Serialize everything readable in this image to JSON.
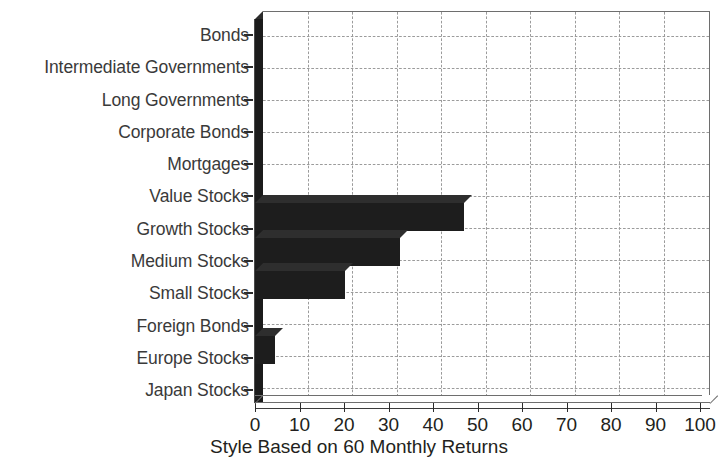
{
  "chart_data": {
    "type": "bar",
    "orientation": "horizontal",
    "title": "",
    "xlabel": "Style Based on 60 Monthly Returns",
    "ylabel": "",
    "categories": [
      "Bonds",
      "Intermediate Governments",
      "Long Governments",
      "Corporate Bonds",
      "Mortgages",
      "Value Stocks",
      "Growth Stocks",
      "Medium Stocks",
      "Small Stocks",
      "Foreign Bonds",
      "Europe Stocks",
      "Japan Stocks"
    ],
    "values": [
      0,
      0,
      0,
      0,
      0,
      0,
      47,
      32,
      20,
      0,
      4.5,
      0
    ],
    "xlim": [
      0,
      100
    ],
    "xticks": [
      0,
      10,
      20,
      30,
      40,
      50,
      60,
      70,
      80,
      90,
      100
    ],
    "xtick_labels": [
      "0",
      "10",
      "20",
      "30",
      "40",
      "50",
      "60",
      "70",
      "80",
      "90",
      "100"
    ],
    "grid": true,
    "grid_style": "dotted",
    "legend": "none",
    "style": "3d-bar",
    "bar_color": "#1d1d1d",
    "grid_color": "#9b9b9b",
    "axis_color": "#4a4a4a",
    "label_color": "#3a3a3a"
  }
}
